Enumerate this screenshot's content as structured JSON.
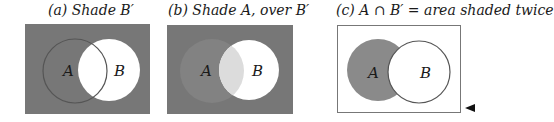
{
  "panels": [
    {
      "id": "a",
      "title": "(a) Shade B′",
      "set_labels": [
        "A",
        "B"
      ],
      "description": "Everything outside B shaded"
    },
    {
      "id": "b",
      "title": "(b) Shade A, over B′",
      "set_labels": [
        "A",
        "B"
      ],
      "description": "A shaded on top of B complement"
    },
    {
      "id": "c",
      "title": "(c) A ∩ B′ = area shaded twice",
      "set_labels": [
        "A",
        "B"
      ],
      "description": "Only A minus B shaded"
    }
  ],
  "colors": {
    "shade": "#777777",
    "shade_light": "#8a8a8a",
    "overlap_light": "#dcdcdc",
    "outline": "#555555",
    "background": "#ffffff"
  },
  "marker": "◀"
}
